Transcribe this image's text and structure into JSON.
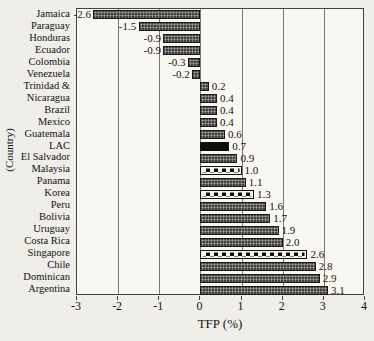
{
  "chart_data": {
    "type": "bar",
    "orientation": "horizontal",
    "xlabel": "TFP (%)",
    "ylabel": "(Country)",
    "xlim": [
      -3,
      4
    ],
    "xticks": [
      "-3",
      "-2",
      "-1",
      "0",
      "1",
      "2",
      "3",
      "4"
    ],
    "grid": true,
    "categories": [
      "Jamaica",
      "Paraguay",
      "Honduras",
      "Ecuador",
      "Colombia",
      "Venezuela",
      "Trinidad &",
      "Nicaragua",
      "Brazil",
      "Mexico",
      "Guatemala",
      "LAC",
      "El Salvador",
      "Malaysia",
      "Panama",
      "Korea",
      "Peru",
      "Bolivia",
      "Uruguay",
      "Costa Rica",
      "Singapore",
      "Chile",
      "Dominican",
      "Argentina"
    ],
    "values": [
      -2.6,
      -1.5,
      -0.9,
      -0.9,
      -0.3,
      -0.2,
      0.2,
      0.4,
      0.4,
      0.4,
      0.6,
      0.7,
      0.9,
      1.0,
      1.1,
      1.3,
      1.6,
      1.7,
      1.9,
      2.0,
      2.6,
      2.8,
      2.9,
      3.1
    ],
    "value_labels": [
      "-2.6",
      "-1.5",
      "-0.9",
      "-0.9",
      "-0.3",
      "-0.2",
      "0.2",
      "0.4",
      "0.4",
      "0.4",
      "0.6",
      "0.7",
      "0.9",
      "1.0",
      "1.1",
      "1.3",
      "1.6",
      "1.7",
      "1.9",
      "2.0",
      "2.6",
      "2.8",
      "2.9",
      "3.1"
    ],
    "bar_styles": [
      "dotted",
      "dotted",
      "dotted",
      "dotted",
      "dotted",
      "dotted",
      "dotted",
      "dotted",
      "dotted",
      "dotted",
      "dotted",
      "solid-black",
      "dotted",
      "checker",
      "dotted",
      "checker",
      "dotted",
      "dotted",
      "dotted",
      "dotted",
      "checker",
      "dotted",
      "dotted",
      "dotted"
    ],
    "colors": {
      "background": "#f0eee9",
      "plot_background": "#f8f7f2",
      "grid_line": "#7a7770",
      "axis_line": "#44423e",
      "bar_dark": "#413f3c",
      "bar_black": "#0f0e0c",
      "checker_dark": "#14120f",
      "checker_light": "#f6f4ee"
    }
  }
}
